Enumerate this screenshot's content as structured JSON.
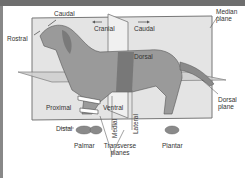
{
  "banner": {
    "color": "#6e6e6e"
  },
  "labels": {
    "caudal_top": "Caudal",
    "rostral": "Rostral",
    "cranial": "Cranial",
    "caudal_right": "Caudal",
    "median_plane": "Median plane",
    "dorsal": "Dorsal",
    "dorsal_plane": "Dorsal plane",
    "proximal": "Proximal",
    "ventral": "Ventral",
    "distal": "Distal",
    "medial": "Medial",
    "lateral": "Lateral",
    "palmar": "Palmar",
    "transverse_planes": "Transverse planes",
    "plantar": "Plantar"
  },
  "colors": {
    "plane": "#d8d8d8",
    "plane_edge": "#777777",
    "dog": "#9a9a9a",
    "dog_dark": "#6a6a6a",
    "arrow": "#555555"
  }
}
